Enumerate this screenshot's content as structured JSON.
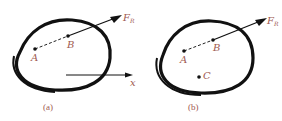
{
  "figures": [
    {
      "id": "a",
      "caption": "(a)",
      "points": [
        {
          "name": "A",
          "label": "A"
        },
        {
          "name": "B",
          "label": "B"
        }
      ],
      "force": {
        "symbol": "F",
        "subscript": "R",
        "subscript_note": "assumed; illegible at this resolution"
      },
      "axis": {
        "label": "x"
      }
    },
    {
      "id": "b",
      "caption": "(b)",
      "points": [
        {
          "name": "A",
          "label": "A"
        },
        {
          "name": "B",
          "label": "B"
        },
        {
          "name": "C",
          "label": "C"
        }
      ],
      "force": {
        "symbol": "F",
        "subscript": "R",
        "subscript_note": "assumed; illegible at this resolution"
      }
    }
  ],
  "colors": {
    "outline": "#111111",
    "label": "#a05a50"
  }
}
